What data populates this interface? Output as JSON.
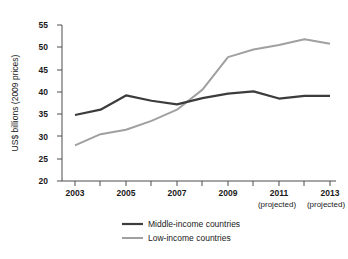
{
  "chart_data": {
    "type": "line",
    "title": "",
    "xlabel": "",
    "ylabel": "US$ billions (2009 prices)",
    "ylim": [
      20,
      55
    ],
    "yticks": [
      20,
      25,
      30,
      35,
      40,
      45,
      50,
      55
    ],
    "ytick_labels": [
      "20",
      "25",
      "30",
      "35",
      "40",
      "45",
      "50",
      "55"
    ],
    "x": [
      2003,
      2004,
      2005,
      2006,
      2007,
      2008,
      2009,
      2010,
      2011,
      2012,
      2013
    ],
    "categories": [
      "2003",
      "2004",
      "2005",
      "2006",
      "2007",
      "2008",
      "2009",
      "2010",
      "2011",
      "2012",
      "2013"
    ],
    "xtick_labels": [
      "2003",
      "",
      "2005",
      "",
      "2007",
      "",
      "2009",
      "",
      "2011",
      "",
      "2013"
    ],
    "xtick_sublabels": [
      "",
      "",
      "",
      "",
      "",
      "",
      "",
      "",
      "(projected)",
      "",
      "(projected)"
    ],
    "grid": false,
    "legend_position": "bottom-center",
    "series": [
      {
        "name": "Middle-income countries",
        "color": "#3c3c3c",
        "width": 2.2,
        "values": [
          34.8,
          36.0,
          39.2,
          38.0,
          37.2,
          38.6,
          39.6,
          40.1,
          38.5,
          39.1,
          39.1
        ]
      },
      {
        "name": "Low-income countries",
        "color": "#a0a0a0",
        "width": 2.0,
        "values": [
          28.0,
          30.5,
          31.5,
          33.5,
          36.0,
          40.5,
          47.8,
          49.5,
          50.5,
          51.8,
          50.8
        ]
      }
    ]
  },
  "legend": {
    "items": [
      {
        "label": "Middle-income countries",
        "color": "#3c3c3c"
      },
      {
        "label": "Low-income countries",
        "color": "#a0a0a0"
      }
    ]
  },
  "colors": {
    "background": "#ffffff",
    "axis": "#4d4d4d",
    "text": "#1a1a1a",
    "middle_income": "#3c3c3c",
    "low_income": "#a0a0a0"
  }
}
